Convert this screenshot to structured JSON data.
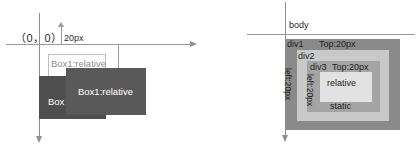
{
  "diagrams": [
    {
      "id": "coordinate-offset-diagram",
      "axes": {
        "origin_label": "（0，0）",
        "offset_label": "20px",
        "horizontal_axis_name": "x-axis",
        "vertical_axis_name": "y-axis"
      },
      "boxes": [
        {
          "name": "box-relative-outline",
          "label": "Box1:relative"
        },
        {
          "name": "box-relative-filled",
          "label": "Box1:relative"
        },
        {
          "name": "box-static",
          "label": "Box"
        }
      ]
    },
    {
      "id": "nested-position-diagram",
      "axes": {
        "horizontal_axis_name": "x-axis",
        "vertical_axis_name": "y-axis"
      },
      "labels": {
        "body": "body",
        "div1": "div1",
        "div2": "div2",
        "div3": "div3",
        "div1_top": "Top:20px",
        "div1_left": "left:20px",
        "div3_top": "Top:20px",
        "div3_left": "left:20px",
        "relative": "relative",
        "static": "static"
      }
    }
  ],
  "colors": {
    "axis": "#8f8f8f",
    "box_static": "#4f4f4f",
    "box_relative": "#595959",
    "div1": "#8a8a8a",
    "div2": "#c9c9c9",
    "div3": "#a4a4a4",
    "div_relative": "#e2e2e2",
    "text_dark": "#1f1f1f",
    "text_light": "#ffffff"
  }
}
